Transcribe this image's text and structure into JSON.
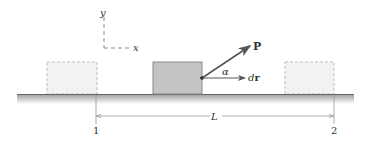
{
  "diagram": {
    "axes": {
      "y_label": "y",
      "x_label": "x"
    },
    "force_label": "P",
    "angle_label": "α",
    "displacement_label": "dr",
    "displacement_prefix": "d",
    "displacement_vector": "r",
    "distance_label": "L",
    "position_1": "1",
    "position_2": "2",
    "colors": {
      "block_fill": "#c4c4c4",
      "block_stroke": "#8a8a8a",
      "ghost_fill": "#f2f2f2",
      "ghost_stroke": "#bdbdbd",
      "ground": "#7a7a7a",
      "arrow": "#555555"
    }
  }
}
